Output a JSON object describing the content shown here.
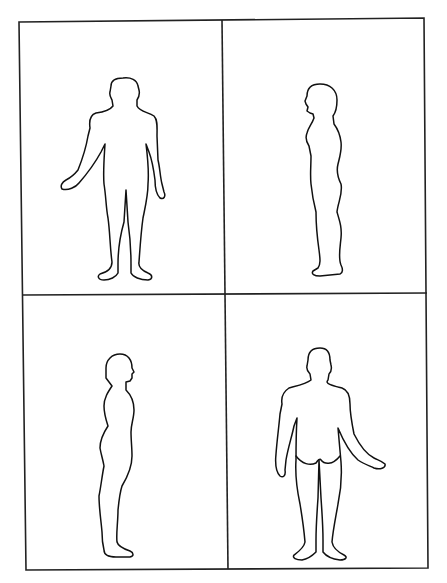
{
  "diagram": {
    "type": "body-chart",
    "layout": "2x2 grid",
    "panels": [
      {
        "position": "top-left",
        "view": "front"
      },
      {
        "position": "top-right",
        "view": "side-left-facing"
      },
      {
        "position": "bottom-left",
        "view": "side-right-facing"
      },
      {
        "position": "bottom-right",
        "view": "back"
      }
    ],
    "colors": {
      "stroke": "#111111",
      "background": "#ffffff"
    }
  }
}
